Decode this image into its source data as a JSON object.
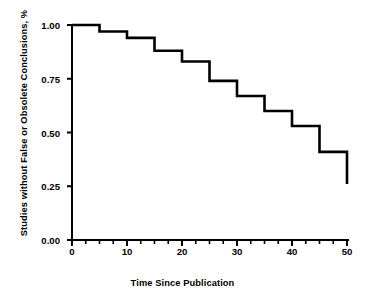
{
  "chart_data": {
    "type": "line",
    "subtype": "kaplan-meier-step",
    "title": "",
    "xlabel": "Time Since Publication",
    "ylabel": "Studies without False or Obsolete Conclusions, %",
    "xlim": [
      0,
      50
    ],
    "ylim": [
      0.0,
      1.0
    ],
    "grid": false,
    "legend": null,
    "xticks": [
      0,
      10,
      20,
      30,
      40,
      50
    ],
    "xtick_labels": [
      "0",
      "10",
      "20",
      "30",
      "40",
      "50"
    ],
    "xminor_tick_interval": 2.5,
    "yticks": [
      0.0,
      0.25,
      0.5,
      0.75,
      1.0
    ],
    "ytick_labels": [
      "0.00",
      "0.25",
      "0.50",
      "0.75",
      "1.00"
    ],
    "line_color": "#000000",
    "line_width": 2.6,
    "x": [
      0,
      5,
      10,
      15,
      20,
      25,
      30,
      35,
      40,
      45,
      50
    ],
    "y": [
      1.0,
      0.97,
      0.94,
      0.88,
      0.83,
      0.74,
      0.67,
      0.6,
      0.53,
      0.41,
      0.26
    ],
    "steps": [
      {
        "x_start": 0,
        "x_end": 5,
        "value": 1.0
      },
      {
        "x_start": 5,
        "x_end": 10,
        "value": 0.97
      },
      {
        "x_start": 10,
        "x_end": 15,
        "value": 0.94
      },
      {
        "x_start": 15,
        "x_end": 20,
        "value": 0.88
      },
      {
        "x_start": 20,
        "x_end": 25,
        "value": 0.83
      },
      {
        "x_start": 25,
        "x_end": 30,
        "value": 0.74
      },
      {
        "x_start": 30,
        "x_end": 35,
        "value": 0.67
      },
      {
        "x_start": 35,
        "x_end": 40,
        "value": 0.6
      },
      {
        "x_start": 40,
        "x_end": 45,
        "value": 0.53
      },
      {
        "x_start": 45,
        "x_end": 50,
        "value": 0.41
      },
      {
        "x_start": 50,
        "x_end": 50,
        "value": 0.26
      }
    ]
  }
}
